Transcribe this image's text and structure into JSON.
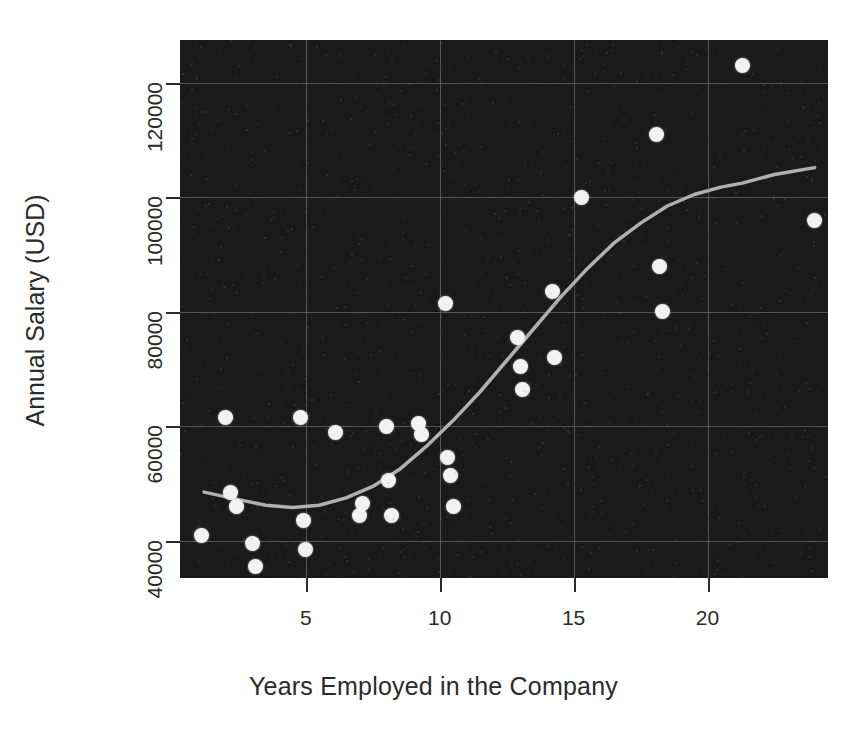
{
  "chart_data": {
    "type": "scatter",
    "title": "",
    "xlabel": "Years Employed in the Company",
    "ylabel": "Annual Salary (USD)",
    "xlim": [
      0.3,
      24.5
    ],
    "ylim": [
      33500,
      127500
    ],
    "xticks": [
      5,
      10,
      15,
      20
    ],
    "xtick_labels": [
      "5",
      "10",
      "15",
      "20"
    ],
    "yticks": [
      40000,
      60000,
      80000,
      100000,
      120000
    ],
    "ytick_labels": [
      "40000",
      "60000",
      "80000",
      "100000",
      "120000"
    ],
    "grid": true,
    "legend": "none",
    "background_color": "#1a1a1a",
    "marker_color": "#f2f2f2",
    "trend_color": "#b0b0b0",
    "points": [
      {
        "x": 1.1,
        "y": 41000
      },
      {
        "x": 2.0,
        "y": 61500
      },
      {
        "x": 2.2,
        "y": 48500
      },
      {
        "x": 2.4,
        "y": 46000
      },
      {
        "x": 3.0,
        "y": 39500
      },
      {
        "x": 3.1,
        "y": 35500
      },
      {
        "x": 4.8,
        "y": 61500
      },
      {
        "x": 4.9,
        "y": 43500
      },
      {
        "x": 5.0,
        "y": 38500
      },
      {
        "x": 6.1,
        "y": 59000
      },
      {
        "x": 7.0,
        "y": 44500
      },
      {
        "x": 7.1,
        "y": 46500
      },
      {
        "x": 8.0,
        "y": 60000
      },
      {
        "x": 8.1,
        "y": 50500
      },
      {
        "x": 8.2,
        "y": 44500
      },
      {
        "x": 9.2,
        "y": 60500
      },
      {
        "x": 9.3,
        "y": 58500
      },
      {
        "x": 10.2,
        "y": 81500
      },
      {
        "x": 10.3,
        "y": 54500
      },
      {
        "x": 10.4,
        "y": 51500
      },
      {
        "x": 10.5,
        "y": 46000
      },
      {
        "x": 12.9,
        "y": 75500
      },
      {
        "x": 13.0,
        "y": 70500
      },
      {
        "x": 13.1,
        "y": 66500
      },
      {
        "x": 14.2,
        "y": 83500
      },
      {
        "x": 14.3,
        "y": 72000
      },
      {
        "x": 15.3,
        "y": 100000
      },
      {
        "x": 18.1,
        "y": 111000
      },
      {
        "x": 18.2,
        "y": 88000
      },
      {
        "x": 18.3,
        "y": 80000
      },
      {
        "x": 21.3,
        "y": 123000
      },
      {
        "x": 24.0,
        "y": 96000
      }
    ],
    "trend_line": [
      {
        "x": 1.2,
        "y": 48500
      },
      {
        "x": 2.5,
        "y": 47200
      },
      {
        "x": 3.5,
        "y": 46200
      },
      {
        "x": 4.5,
        "y": 45800
      },
      {
        "x": 5.5,
        "y": 46200
      },
      {
        "x": 6.5,
        "y": 47500
      },
      {
        "x": 7.5,
        "y": 49500
      },
      {
        "x": 8.5,
        "y": 52500
      },
      {
        "x": 9.5,
        "y": 56500
      },
      {
        "x": 10.5,
        "y": 61000
      },
      {
        "x": 11.5,
        "y": 66000
      },
      {
        "x": 12.5,
        "y": 71500
      },
      {
        "x": 13.5,
        "y": 77000
      },
      {
        "x": 14.5,
        "y": 82500
      },
      {
        "x": 15.5,
        "y": 87500
      },
      {
        "x": 16.5,
        "y": 92000
      },
      {
        "x": 17.5,
        "y": 95500
      },
      {
        "x": 18.5,
        "y": 98500
      },
      {
        "x": 19.5,
        "y": 100500
      },
      {
        "x": 20.5,
        "y": 101800
      },
      {
        "x": 21.3,
        "y": 102500
      },
      {
        "x": 22.5,
        "y": 104000
      },
      {
        "x": 24.0,
        "y": 105200
      }
    ]
  }
}
